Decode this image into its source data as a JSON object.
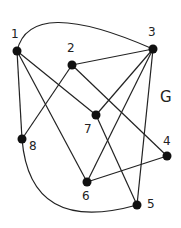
{
  "graph": {
    "name": "G",
    "nodes": [
      {
        "id": "1",
        "x": 17,
        "y": 51,
        "lx": 11,
        "ly": 38
      },
      {
        "id": "2",
        "x": 72,
        "y": 65,
        "lx": 67,
        "ly": 52
      },
      {
        "id": "3",
        "x": 153,
        "y": 49,
        "lx": 148,
        "ly": 36
      },
      {
        "id": "4",
        "x": 167,
        "y": 156,
        "lx": 163,
        "ly": 145
      },
      {
        "id": "5",
        "x": 137,
        "y": 205,
        "lx": 147,
        "ly": 208
      },
      {
        "id": "6",
        "x": 87,
        "y": 182,
        "lx": 82,
        "ly": 200
      },
      {
        "id": "7",
        "x": 96,
        "y": 115,
        "lx": 84,
        "ly": 133
      },
      {
        "id": "8",
        "x": 22,
        "y": 139,
        "lx": 29,
        "ly": 150
      }
    ],
    "edges": [
      [
        "1",
        "3"
      ],
      [
        "1",
        "8"
      ],
      [
        "1",
        "6"
      ],
      [
        "1",
        "7"
      ],
      [
        "2",
        "3"
      ],
      [
        "2",
        "8"
      ],
      [
        "2",
        "4"
      ],
      [
        "3",
        "7"
      ],
      [
        "3",
        "6"
      ],
      [
        "3",
        "5"
      ],
      [
        "6",
        "4"
      ],
      [
        "7",
        "5"
      ],
      [
        "8",
        "5"
      ]
    ],
    "curved_edges": {
      "1-3": "M17,51 Q30,-5 153,49",
      "8-5": "M22,139 Q30,235 137,205"
    },
    "label_position": {
      "x": 160,
      "y": 102
    }
  }
}
